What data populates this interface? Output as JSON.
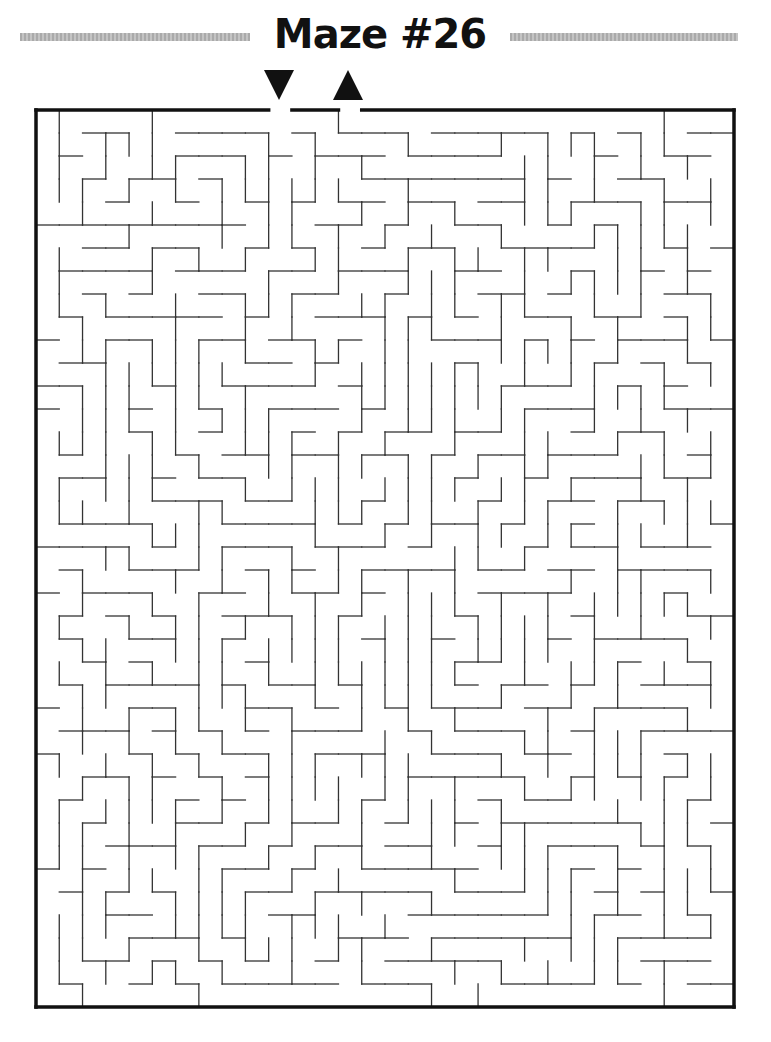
{
  "header": {
    "title": "Maze #26"
  },
  "markers": {
    "start_icon": "down-triangle-arrow-icon",
    "end_icon": "up-triangle-arrow-icon"
  },
  "maze": {
    "left": 36,
    "top": 110,
    "width": 698,
    "height": 897,
    "cols": 30,
    "rows": 39,
    "entrance_col": 10,
    "exit_col": 13,
    "wall_color": "#333333",
    "border_color": "#111111",
    "seed": 26
  }
}
